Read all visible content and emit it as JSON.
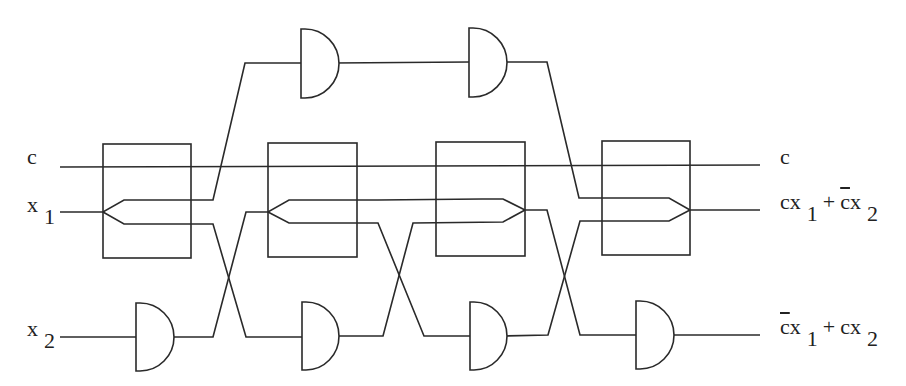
{
  "diagram": {
    "title": "",
    "type": "reversible logic circuit (controlled swap)",
    "inputs": {
      "c": {
        "var": "c"
      },
      "x1": {
        "var": "x",
        "sub": "1"
      },
      "x2": {
        "var": "x",
        "sub": "2"
      }
    },
    "outputs": {
      "c": {
        "text": "c"
      },
      "out1": {
        "t1": "cx",
        "s1": "1",
        "op": "+",
        "t2bar": "c",
        "t2": "x",
        "s2": "2"
      },
      "out2": {
        "t1bar": "c",
        "t1": "x",
        "s1": "1",
        "op": "+",
        "t2": "cx",
        "s2": "2"
      }
    },
    "components": {
      "boxes": 4,
      "and_gates_top": 2,
      "and_gates_bottom": 4
    },
    "colors": {
      "stroke": "#2a2a2a",
      "background": "#ffffff"
    }
  }
}
